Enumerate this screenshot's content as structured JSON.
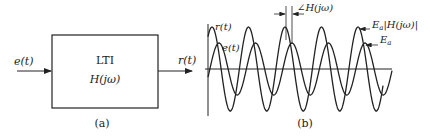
{
  "figure_a": {
    "input_label": "e(t)",
    "output_label": "r(t)",
    "block_title": "LTI",
    "block_transfer": "H(jω)",
    "caption": "(a)"
  },
  "figure_b": {
    "caption": "(b)",
    "signal_output_label": "r(t)",
    "signal_input_label": "e(t)",
    "phase_label": "∠H(jω)",
    "output_amplitude_label": "E_a|H(jω)|",
    "output_amplitude_base": "E",
    "output_amplitude_sub": "a",
    "output_amplitude_rest": "|H(jω)|",
    "input_amplitude_base": "E",
    "input_amplitude_sub": "a",
    "waves": {
      "period_px": 36.5,
      "axis_y": 69,
      "r_amplitude": 42,
      "e_amplitude": 26,
      "r_first_peak_x": 212,
      "phase_shift_px": 7
    }
  }
}
